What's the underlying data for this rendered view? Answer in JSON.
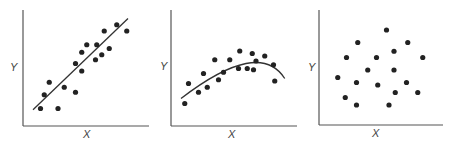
{
  "colors": {
    "axis": "#555555",
    "point": "#222222",
    "fit": "#333333",
    "label": "#444444"
  },
  "chart_data": [
    {
      "type": "scatter",
      "title": "",
      "xlabel": "X",
      "ylabel": "Y",
      "xlim": [
        0,
        10
      ],
      "ylim": [
        0,
        10
      ],
      "grid": false,
      "ticks": false,
      "relationship": "positive linear",
      "points": [
        [
          1.4,
          1.4
        ],
        [
          2.8,
          1.4
        ],
        [
          1.7,
          2.5
        ],
        [
          2.1,
          3.5
        ],
        [
          3.3,
          3.1
        ],
        [
          4.2,
          2.7
        ],
        [
          4.2,
          5.0
        ],
        [
          4.7,
          4.4
        ],
        [
          4.7,
          5.9
        ],
        [
          5.1,
          6.5
        ],
        [
          5.8,
          5.3
        ],
        [
          5.9,
          6.5
        ],
        [
          6.3,
          5.7
        ],
        [
          6.9,
          6.2
        ],
        [
          6.5,
          7.6
        ],
        [
          7.5,
          8.1
        ],
        [
          8.3,
          7.6
        ]
      ],
      "fit": {
        "kind": "linear",
        "from": [
          0.8,
          1.3
        ],
        "to": [
          8.4,
          8.6
        ]
      }
    },
    {
      "type": "scatter",
      "title": "",
      "xlabel": "X",
      "ylabel": "Y",
      "xlim": [
        0,
        10
      ],
      "ylim": [
        0,
        10
      ],
      "grid": false,
      "ticks": false,
      "relationship": "curvilinear (inverted U)",
      "points": [
        [
          1.1,
          1.8
        ],
        [
          1.4,
          3.4
        ],
        [
          2.2,
          2.7
        ],
        [
          2.6,
          4.2
        ],
        [
          2.9,
          3.1
        ],
        [
          3.5,
          5.3
        ],
        [
          3.8,
          3.7
        ],
        [
          4.2,
          4.3
        ],
        [
          4.7,
          5.3
        ],
        [
          5.5,
          6.0
        ],
        [
          5.4,
          4.6
        ],
        [
          6.1,
          4.6
        ],
        [
          6.5,
          5.8
        ],
        [
          6.6,
          4.5
        ],
        [
          6.8,
          5.2
        ],
        [
          7.5,
          5.6
        ],
        [
          8.2,
          4.9
        ],
        [
          8.3,
          3.6
        ]
      ],
      "fit": {
        "kind": "quadratic",
        "from": [
          0.8,
          2.2
        ],
        "peak": [
          6.0,
          5.0
        ],
        "to": [
          9.1,
          3.8
        ]
      }
    },
    {
      "type": "scatter",
      "title": "",
      "xlabel": "X",
      "ylabel": "Y",
      "xlim": [
        0,
        10
      ],
      "ylim": [
        0,
        10
      ],
      "grid": false,
      "ticks": false,
      "relationship": "no correlation",
      "points": [
        [
          5.4,
          7.6
        ],
        [
          3.1,
          6.6
        ],
        [
          7.1,
          6.6
        ],
        [
          6.0,
          5.9
        ],
        [
          2.2,
          5.4
        ],
        [
          4.6,
          5.4
        ],
        [
          8.3,
          5.4
        ],
        [
          3.9,
          4.4
        ],
        [
          6.0,
          4.4
        ],
        [
          1.5,
          3.8
        ],
        [
          3.0,
          3.4
        ],
        [
          4.7,
          3.2
        ],
        [
          7.0,
          3.4
        ],
        [
          6.1,
          2.6
        ],
        [
          7.9,
          2.6
        ],
        [
          2.1,
          2.2
        ],
        [
          3.0,
          1.6
        ],
        [
          5.6,
          1.6
        ]
      ],
      "fit": null
    }
  ],
  "layout": [
    {
      "left": 0,
      "origin": [
        23,
        126
      ],
      "axisLen": [
        126,
        116
      ],
      "yLabelPos": [
        10,
        62
      ],
      "xLabelPos": [
        83,
        129
      ]
    },
    {
      "left": 150,
      "origin": [
        21,
        126
      ],
      "axisLen": [
        126,
        116
      ],
      "yLabelPos": [
        10,
        61
      ],
      "xLabelPos": [
        78,
        129
      ]
    },
    {
      "left": 300,
      "origin": [
        19,
        125
      ],
      "axisLen": [
        124,
        115
      ],
      "yLabelPos": [
        8,
        62
      ],
      "xLabelPos": [
        72,
        128
      ]
    }
  ],
  "scale": 12.5
}
